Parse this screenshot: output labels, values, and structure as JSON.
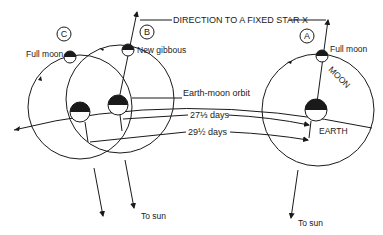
{
  "diagram": {
    "title_line": "DIRECTION TO A FIXED STAR X",
    "positions": [
      {
        "id": "A",
        "label": "A",
        "moon_label": "Full moon"
      },
      {
        "id": "B",
        "label": "B",
        "moon_label": "New gibbous"
      },
      {
        "id": "C",
        "label": "C",
        "moon_label": "Full moon"
      }
    ],
    "labels": {
      "orbit": "Earth-moon orbit",
      "sidereal": "27⅓ days",
      "synodic": "29½ days",
      "moon": "MOON",
      "earth": "EARTH",
      "to_sun_left": "To sun",
      "to_sun_right": "To sun"
    },
    "colors": {
      "ink": "#1a1a1a",
      "background": "#ffffff"
    }
  }
}
